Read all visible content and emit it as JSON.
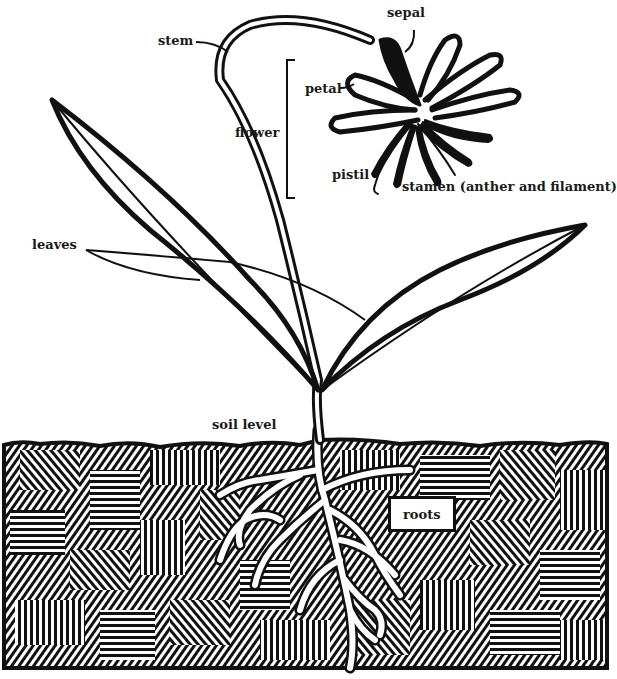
{
  "diagram": {
    "type": "labeled plant anatomy illustration",
    "colors": {
      "ink": "#111111",
      "paper": "#ffffff"
    },
    "labels": {
      "sepal": "sepal",
      "stem": "stem",
      "petal": "petal",
      "flower": "flower",
      "pistil": "pistil",
      "stamen": "stamen (anther and filament)",
      "leaves": "leaves",
      "soil_level": "soil level",
      "roots": "roots"
    }
  }
}
